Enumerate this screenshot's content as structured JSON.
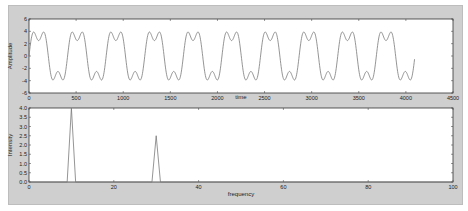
{
  "chart_data": [
    {
      "type": "line",
      "title": "",
      "xlabel": "time",
      "ylabel": "Amplitude",
      "xlim": [
        0,
        4500
      ],
      "ylim": [
        -6,
        6
      ],
      "xticks": [
        0,
        500,
        1000,
        1500,
        2000,
        2500,
        3000,
        3500,
        4000,
        4500
      ],
      "yticks": [
        -6,
        -4,
        -2,
        0,
        2,
        4,
        6
      ],
      "grid": false,
      "series": [
        {
          "name": "signal",
          "formula": "4*sin(2*pi*10*n/4096) + 1.5*sin(2*pi*30*n/4096)",
          "n_samples": 4096,
          "color": "#7a7a7a"
        }
      ]
    },
    {
      "type": "line",
      "title": "",
      "xlabel": "frequency",
      "ylabel": "Intensity",
      "xlim": [
        0,
        100
      ],
      "ylim": [
        0,
        4.0
      ],
      "xticks": [
        0,
        20,
        40,
        60,
        80,
        100
      ],
      "yticks": [
        0.0,
        0.5,
        1.0,
        1.5,
        2.0,
        2.5,
        3.0,
        3.5,
        4.0
      ],
      "grid": false,
      "x": [
        0,
        9,
        10,
        11,
        29,
        30,
        31,
        100
      ],
      "series": [
        {
          "name": "spectrum",
          "values": [
            0,
            0,
            4.0,
            0,
            0,
            2.5,
            0,
            0
          ],
          "color": "#7a7a7a"
        }
      ]
    }
  ],
  "labels": {
    "top_xlabel": "time",
    "top_ylabel": "Amplitude",
    "bottom_xlabel": "frequency",
    "bottom_ylabel": "Intensity"
  }
}
